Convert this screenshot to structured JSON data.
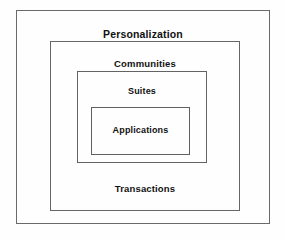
{
  "diagram": {
    "type": "nested-boxes",
    "canvas": {
      "width": 284,
      "height": 241,
      "background": "#ffffff"
    },
    "stroke_color": "#5b5b5b",
    "text_color": "#111111",
    "layers": [
      {
        "id": "personalization",
        "label": "Personalization",
        "level": 1,
        "rect": {
          "x": 16,
          "y": 10,
          "width": 254,
          "height": 214
        }
      },
      {
        "id": "communities",
        "label": "Communities",
        "level": 2,
        "rect": {
          "x": 50,
          "y": 41,
          "width": 190,
          "height": 170
        }
      },
      {
        "id": "suites",
        "label": "Suites",
        "level": 3,
        "rect": {
          "x": 77,
          "y": 71,
          "width": 130,
          "height": 92
        }
      },
      {
        "id": "applications",
        "label": "Applications",
        "level": 4,
        "rect": {
          "x": 91,
          "y": 107,
          "width": 99,
          "height": 48
        }
      }
    ],
    "footer_label": {
      "id": "transactions",
      "label": "Transactions",
      "belongs_to": "communities"
    }
  }
}
